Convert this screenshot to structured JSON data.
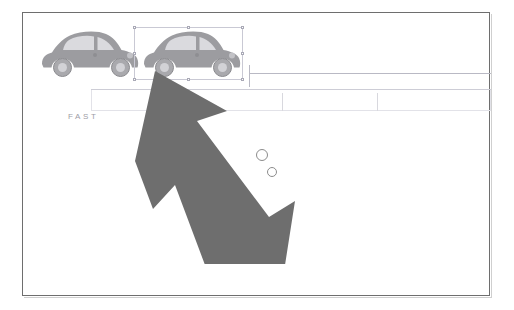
{
  "document": {
    "title": "FAST",
    "label_text": "FAST",
    "background_color": "#ffffff",
    "frame_color": "#6e6e6e"
  },
  "colors": {
    "car_body": "#9c9ca0",
    "car_window": "#d8d8dc",
    "car_outline": "#8a8a8e",
    "arrow_fill": "#6e6e6e",
    "guide_line": "#b9b9c4",
    "band_border": "#e2e2e8",
    "selection_border": "#c9c9d4",
    "label_text": "#9d9da6",
    "bubble_stroke": "#8c8c8c"
  },
  "objects": {
    "cars": [
      {
        "name": "beetle-car-left",
        "label": "vw-beetle-silhouette",
        "x": 38,
        "y": 27,
        "width": 100,
        "height": 50,
        "selected": false
      },
      {
        "name": "beetle-car-right",
        "label": "vw-beetle-silhouette",
        "x": 140,
        "y": 27,
        "width": 100,
        "height": 50,
        "selected": true
      }
    ],
    "selection": {
      "name": "selection-box",
      "x": 133,
      "y": 27,
      "width": 109,
      "height": 52,
      "handle_count": 8
    },
    "bubbles": [
      {
        "cx": 261,
        "cy": 155,
        "r": 5
      },
      {
        "cx": 271,
        "cy": 172,
        "r": 4
      }
    ],
    "arrow": {
      "name": "pointer-arrow",
      "direction": "up-left",
      "tip_x": 134,
      "tip_y": 76
    }
  },
  "guides": {
    "horizontal_lines": [
      {
        "x": 248,
        "y": 72,
        "width": 242
      },
      {
        "x": 90,
        "y": 88,
        "width": 400
      }
    ],
    "vertical_ticks": [
      {
        "x": 90,
        "y": 88,
        "height": 22
      },
      {
        "x": 170,
        "y": 88,
        "height": 22
      },
      {
        "x": 248,
        "y": 66,
        "height": 22
      },
      {
        "x": 281,
        "y": 92,
        "height": 18
      },
      {
        "x": 376,
        "y": 92,
        "height": 18
      },
      {
        "x": 489,
        "y": 88,
        "height": 22
      }
    ],
    "band": {
      "x": 90,
      "y": 88,
      "width": 400,
      "height": 22
    }
  }
}
